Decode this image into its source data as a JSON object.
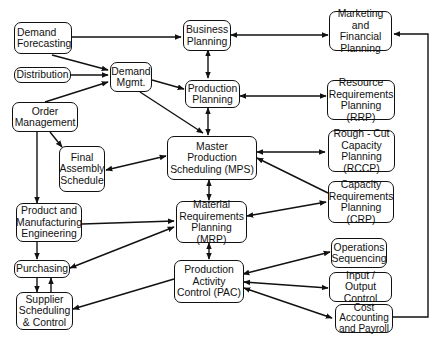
{
  "diagram": {
    "type": "flowchart",
    "nodes": {
      "demand_forecasting": "Demand\nForecasting",
      "distribution": "Distribution",
      "order_management": "Order\nManagement",
      "demand_mgmt": "Demand\nMgmt.",
      "business_planning": "Business\nPlanning",
      "marketing_financial": "Marketing\nand Financial\nPlanning",
      "production_planning": "Production\nPlanning",
      "rrp": "Resource\nRequirements\nPlanning (RRP)",
      "final_assembly": "Final\nAssembly\nSchedule",
      "mps": "Master\nProduction\nScheduling (MPS)",
      "rccp": "Rough - Cut\nCapacity\nPlanning (RCCP)",
      "product_engineering": "Product and\nManufacturing\nEngineering",
      "mrp": "Material\nRequirements\nPlanning (MRP)",
      "crp": "Capacity\nRequirements\nPlanning (CRP)",
      "purchasing": "Purchasing",
      "pac": "Production\nActivity\nControl (PAC)",
      "operations_sequencing": "Operations\nSequencing",
      "supplier_scheduling": "Supplier\nScheduling\n& Control",
      "input_output": "Input / Output\nControl",
      "cost_accounting": "Cost\nAccounting\nand Payroll"
    },
    "edges": [
      {
        "from": "Demand Forecasting",
        "to": "Business Planning",
        "type": "directed"
      },
      {
        "from": "Demand Forecasting",
        "to": "Demand Mgmt.",
        "type": "directed"
      },
      {
        "from": "Distribution",
        "to": "Demand Mgmt.",
        "type": "directed"
      },
      {
        "from": "Order Management",
        "to": "Demand Mgmt.",
        "type": "directed"
      },
      {
        "from": "Demand Mgmt.",
        "to": "Production Planning",
        "type": "directed"
      },
      {
        "from": "Demand Mgmt.",
        "to": "Master Production Scheduling (MPS)",
        "type": "directed"
      },
      {
        "from": "Business Planning",
        "to": "Marketing and Financial Planning",
        "type": "bidirectional"
      },
      {
        "from": "Business Planning",
        "to": "Production Planning",
        "type": "bidirectional"
      },
      {
        "from": "Production Planning",
        "to": "Resource Requirements Planning (RRP)",
        "type": "bidirectional"
      },
      {
        "from": "Production Planning",
        "to": "Master Production Scheduling (MPS)",
        "type": "bidirectional"
      },
      {
        "from": "Order Management",
        "to": "Final Assembly Schedule",
        "type": "directed"
      },
      {
        "from": "Order Management",
        "to": "Product and Manufacturing Engineering",
        "type": "directed"
      },
      {
        "from": "Final Assembly Schedule",
        "to": "Master Production Scheduling (MPS)",
        "type": "bidirectional"
      },
      {
        "from": "Master Production Scheduling (MPS)",
        "to": "Rough-Cut Capacity Planning (RCCP)",
        "type": "bidirectional"
      },
      {
        "from": "Capacity Requirements Planning (CRP)",
        "to": "Master Production Scheduling (MPS)",
        "type": "directed"
      },
      {
        "from": "Master Production Scheduling (MPS)",
        "to": "Material Requirements Planning (MRP)",
        "type": "bidirectional"
      },
      {
        "from": "Product and Manufacturing Engineering",
        "to": "Material Requirements Planning (MRP)",
        "type": "directed"
      },
      {
        "from": "Material Requirements Planning (MRP)",
        "to": "Capacity Requirements Planning (CRP)",
        "type": "bidirectional"
      },
      {
        "from": "Product and Manufacturing Engineering",
        "to": "Purchasing",
        "type": "directed"
      },
      {
        "from": "Purchasing",
        "to": "Material Requirements Planning (MRP)",
        "type": "bidirectional"
      },
      {
        "from": "Purchasing",
        "to": "Supplier Scheduling & Control",
        "type": "directed"
      },
      {
        "from": "Supplier Scheduling & Control",
        "to": "Purchasing",
        "type": "directed"
      },
      {
        "from": "Material Requirements Planning (MRP)",
        "to": "Production Activity Control (PAC)",
        "type": "bidirectional"
      },
      {
        "from": "Production Activity Control (PAC)",
        "to": "Supplier Scheduling & Control",
        "type": "directed"
      },
      {
        "from": "Production Activity Control (PAC)",
        "to": "Operations Sequencing",
        "type": "bidirectional"
      },
      {
        "from": "Production Activity Control (PAC)",
        "to": "Input / Output Control",
        "type": "bidirectional"
      },
      {
        "from": "Production Activity Control (PAC)",
        "to": "Cost Accounting and Payroll",
        "type": "bidirectional"
      },
      {
        "from": "Cost Accounting and Payroll",
        "to": "Marketing and Financial Planning",
        "type": "directed"
      }
    ]
  }
}
